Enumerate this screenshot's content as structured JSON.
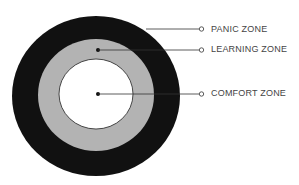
{
  "diagram": {
    "type": "concentric-zones",
    "colors": {
      "panic": "#111111",
      "learning": "#b3b3b3",
      "comfort": "#ffffff",
      "line": "#333333"
    },
    "zones": [
      {
        "id": "panic",
        "label": "PANIC ZONE"
      },
      {
        "id": "learning",
        "label": "LEARNING ZONE"
      },
      {
        "id": "comfort",
        "label": "COMFORT ZONE"
      }
    ]
  }
}
